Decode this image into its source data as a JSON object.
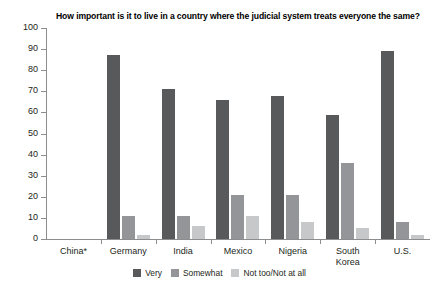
{
  "chart_data": {
    "type": "bar",
    "title": "How important is it to live in a country where the judicial system treats everyone the same?",
    "xlabel": "",
    "ylabel": "",
    "ylim": [
      0,
      100
    ],
    "ytick_step": 10,
    "yticks": [
      "100",
      "90",
      "80",
      "70",
      "60",
      "50",
      "40",
      "30",
      "20",
      "10",
      "0"
    ],
    "grid": false,
    "legend_position": "bottom",
    "categories": [
      "China*",
      "Germany",
      "India",
      "Mexico",
      "Nigeria",
      "South Korea",
      "U.S."
    ],
    "category_lines": [
      [
        "China*"
      ],
      [
        "Germany"
      ],
      [
        "India"
      ],
      [
        "Mexico"
      ],
      [
        "Nigeria"
      ],
      [
        "South",
        "Korea"
      ],
      [
        "U.S."
      ]
    ],
    "series": [
      {
        "name": "Very",
        "color": "#58595b",
        "values": [
          null,
          87,
          71,
          66,
          68,
          59,
          89
        ]
      },
      {
        "name": "Somewhat",
        "color": "#939598",
        "values": [
          null,
          11,
          11,
          21,
          21,
          36,
          8
        ]
      },
      {
        "name": "Not too/Not at all",
        "color": "#c7c8ca",
        "values": [
          null,
          2,
          6,
          11,
          8,
          5,
          2
        ]
      }
    ],
    "note": "China* has no data bars displayed"
  }
}
